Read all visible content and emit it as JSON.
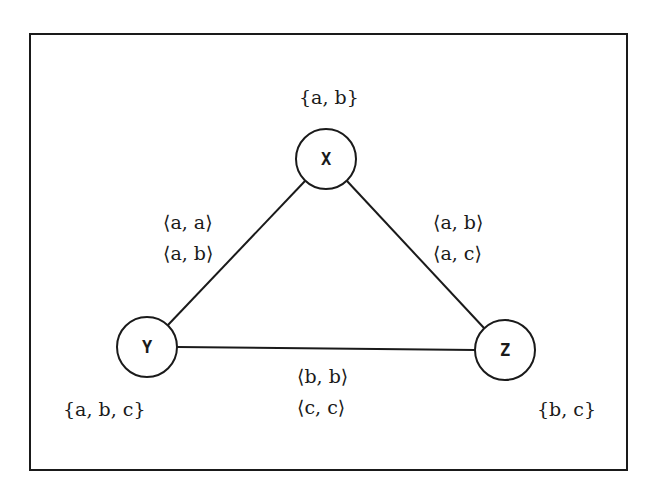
{
  "diagram": {
    "type": "constraint-graph",
    "nodes": [
      {
        "id": "X",
        "label": "X",
        "domain": "{a, b}",
        "cx": 326,
        "cy": 159,
        "r": 30
      },
      {
        "id": "Y",
        "label": "Y",
        "domain": "{a, b, c}",
        "cx": 147,
        "cy": 347,
        "r": 30
      },
      {
        "id": "Z",
        "label": "Z",
        "domain": "{b, c}",
        "cx": 505,
        "cy": 350,
        "r": 30
      }
    ],
    "edges": [
      {
        "from": "X",
        "to": "Y",
        "constraints": [
          "⟨a, a⟩",
          "⟨a, b⟩"
        ]
      },
      {
        "from": "X",
        "to": "Z",
        "constraints": [
          "⟨a, b⟩",
          "⟨a, c⟩"
        ]
      },
      {
        "from": "Y",
        "to": "Z",
        "constraints": [
          "⟨b, b⟩",
          "⟨c, c⟩"
        ]
      }
    ],
    "colors": {
      "ink": "#1a1a1a",
      "background": "#ffffff"
    }
  }
}
